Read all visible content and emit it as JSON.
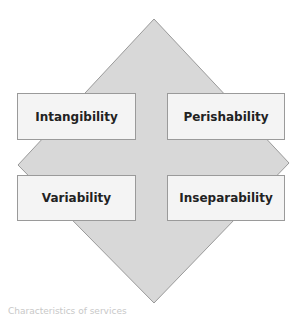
{
  "diagram": {
    "shape": "diamond",
    "fill_color": "#d6d6d6",
    "border_color": "#9a9a9a",
    "boxes": [
      {
        "label": "Intangibility",
        "position": "top-left"
      },
      {
        "label": "Perishability",
        "position": "top-right"
      },
      {
        "label": "Variability",
        "position": "bottom-left"
      },
      {
        "label": "Inseparability",
        "position": "bottom-right"
      }
    ]
  },
  "caption": "Characteristics of services"
}
